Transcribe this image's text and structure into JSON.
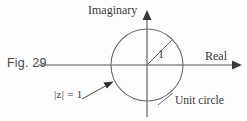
{
  "figure": {
    "caption": "Fig. 29",
    "axes": {
      "imaginary_label": "Imaginary",
      "real_label": "Real"
    },
    "annotations": {
      "unit_circle_label": "Unit circle",
      "modulus_label": "|z| = 1",
      "radius_label": "1"
    },
    "colors": {
      "stroke": "#555555",
      "text": "#3a3a3a",
      "background": "#fdfdfd"
    }
  }
}
